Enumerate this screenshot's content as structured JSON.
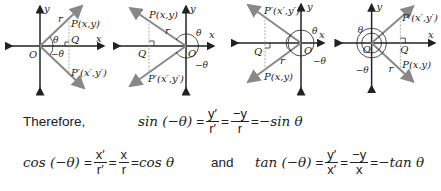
{
  "diagrams": [
    {
      "quadrant": "I",
      "labels": {
        "y": "y",
        "x": "x",
        "origin": "O",
        "r": "r",
        "P": "P(x,y)",
        "Q": "Q",
        "Pprime": "P′(x′,y′)",
        "theta": "θ",
        "neg_theta": "−θ"
      }
    },
    {
      "quadrant": "II",
      "labels": {
        "y": "y",
        "x": "x",
        "origin": "O",
        "r": "r",
        "P": "P(x,y)",
        "Q": "Q",
        "Pprime": "P′(x′,y′)",
        "theta": "θ",
        "neg_theta": "−θ"
      }
    },
    {
      "quadrant": "III",
      "labels": {
        "y": "y",
        "x": "x",
        "origin": "O",
        "r": "r",
        "P": "P(x,y)",
        "Q": "Q",
        "Pprime": "P′(x′,y′)",
        "theta": "θ",
        "neg_theta": "−θ"
      }
    },
    {
      "quadrant": "IV",
      "labels": {
        "y": "y",
        "x": "x",
        "origin": "O",
        "r": "r",
        "P": "P(x,y)",
        "Q": "Q",
        "Pprime": "P′(x′,y′)",
        "theta": "θ",
        "neg_theta": "−θ"
      }
    }
  ],
  "text": {
    "therefore": "Therefore,",
    "and": "and"
  },
  "equations": {
    "sin": {
      "lhs": "sin (−θ)",
      "eq": "=",
      "f1_num": "y′",
      "f1_den": "r′",
      "f2_num": "−y",
      "f2_den": "r",
      "rhs": "−sin θ"
    },
    "cos": {
      "lhs": "cos (−θ)",
      "eq": "=",
      "f1_num": "x′",
      "f1_den": "r′",
      "f2_num": "x",
      "f2_den": "r",
      "rhs": "cos θ"
    },
    "tan": {
      "lhs": "tan (−θ)",
      "eq": "=",
      "f1_num": "y′",
      "f1_den": "x′",
      "f2_num": "−y",
      "f2_den": "x",
      "rhs": "−tan θ"
    }
  },
  "colors": {
    "axis": "#222222",
    "ray": "#8a8a8a",
    "dashed": "#999999",
    "text": "#222222"
  }
}
